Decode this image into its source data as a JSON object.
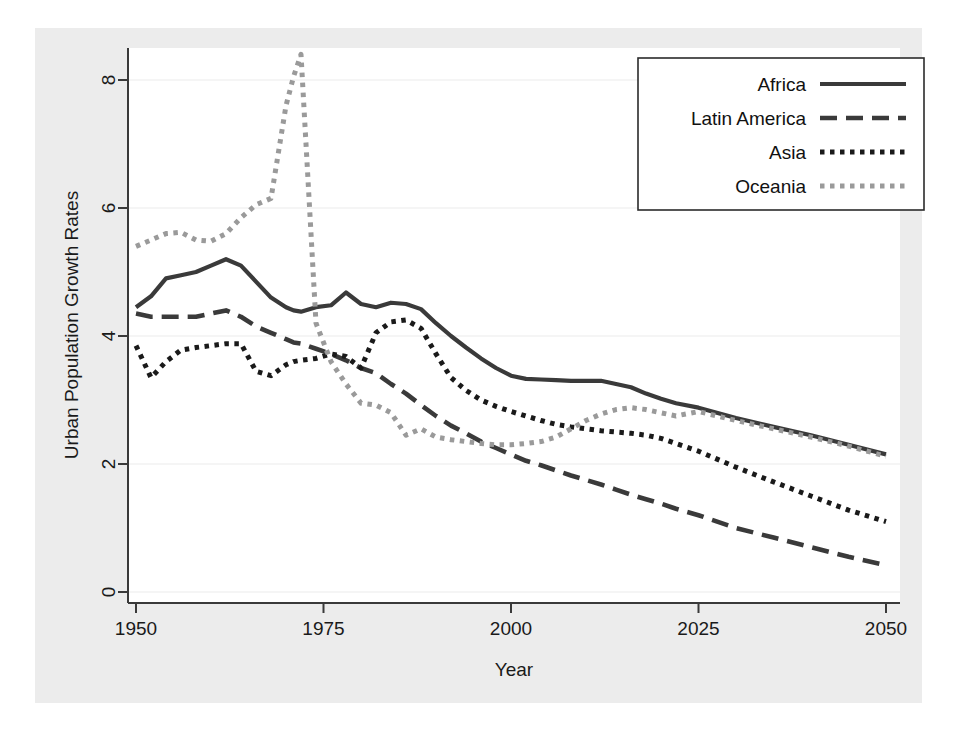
{
  "chart_data": {
    "type": "line",
    "title": "",
    "xlabel": "Year",
    "ylabel": "Urban Population Growth Rates",
    "xlim": [
      1950,
      2050
    ],
    "ylim": [
      0,
      8.6
    ],
    "xticks": [
      1950,
      1975,
      2000,
      2025,
      2050
    ],
    "yticks": [
      0,
      2,
      4,
      6,
      8
    ],
    "grid": "horizontal",
    "legend_position": "top-right",
    "legend_entries": [
      "Africa",
      "Latin America",
      "Asia",
      "Oceania"
    ],
    "x": [
      1950,
      1952,
      1954,
      1956,
      1958,
      1960,
      1962,
      1964,
      1966,
      1968,
      1970,
      1971,
      1972,
      1974,
      1976,
      1978,
      1980,
      1982,
      1984,
      1986,
      1988,
      1990,
      1992,
      1994,
      1996,
      1998,
      2000,
      2002,
      2004,
      2006,
      2008,
      2010,
      2012,
      2014,
      2016,
      2018,
      2020,
      2022,
      2025,
      2030,
      2035,
      2040,
      2045,
      2050
    ],
    "series": [
      {
        "name": "Africa",
        "style": "solid",
        "color": "#3a3a3a",
        "values": [
          4.45,
          4.62,
          4.9,
          4.95,
          5.0,
          5.1,
          5.2,
          5.1,
          4.85,
          4.6,
          4.45,
          4.4,
          4.38,
          4.45,
          4.48,
          4.68,
          4.5,
          4.45,
          4.52,
          4.5,
          4.42,
          4.2,
          4.0,
          3.82,
          3.65,
          3.5,
          3.38,
          3.33,
          3.32,
          3.31,
          3.3,
          3.3,
          3.3,
          3.25,
          3.2,
          3.1,
          3.02,
          2.95,
          2.88,
          2.72,
          2.58,
          2.45,
          2.3,
          2.15
        ]
      },
      {
        "name": "Latin America",
        "style": "dashed",
        "color": "#3a3a3a",
        "values": [
          4.35,
          4.3,
          4.3,
          4.3,
          4.3,
          4.35,
          4.4,
          4.3,
          4.15,
          4.05,
          3.95,
          3.9,
          3.88,
          3.8,
          3.72,
          3.62,
          3.5,
          3.42,
          3.25,
          3.1,
          2.92,
          2.75,
          2.6,
          2.48,
          2.35,
          2.25,
          2.15,
          2.05,
          1.98,
          1.9,
          1.82,
          1.75,
          1.68,
          1.6,
          1.52,
          1.45,
          1.38,
          1.3,
          1.2,
          1.0,
          0.85,
          0.7,
          0.55,
          0.42
        ]
      },
      {
        "name": "Asia",
        "style": "dotted",
        "color": "#1a1a1a",
        "values": [
          3.85,
          3.35,
          3.6,
          3.78,
          3.82,
          3.85,
          3.88,
          3.88,
          3.45,
          3.38,
          3.55,
          3.6,
          3.62,
          3.65,
          3.72,
          3.68,
          3.5,
          4.05,
          4.22,
          4.25,
          4.12,
          3.72,
          3.35,
          3.15,
          3.0,
          2.9,
          2.82,
          2.75,
          2.68,
          2.62,
          2.58,
          2.55,
          2.52,
          2.5,
          2.48,
          2.45,
          2.4,
          2.32,
          2.2,
          1.95,
          1.72,
          1.5,
          1.28,
          1.1
        ]
      },
      {
        "name": "Oceania",
        "style": "dotted-gray",
        "color": "#9a9a9a",
        "values": [
          5.4,
          5.5,
          5.6,
          5.62,
          5.5,
          5.48,
          5.6,
          5.85,
          6.05,
          6.15,
          7.6,
          8.05,
          8.4,
          4.2,
          3.6,
          3.25,
          2.95,
          2.92,
          2.8,
          2.45,
          2.55,
          2.42,
          2.38,
          2.35,
          2.32,
          2.3,
          2.3,
          2.32,
          2.35,
          2.42,
          2.55,
          2.68,
          2.78,
          2.85,
          2.88,
          2.85,
          2.8,
          2.75,
          2.82,
          2.68,
          2.55,
          2.42,
          2.28,
          2.12
        ]
      }
    ]
  },
  "axes": {
    "x_title": "Year",
    "y_title": "Urban Population Growth Rates",
    "x_tick_labels": [
      "1950",
      "1975",
      "2000",
      "2025",
      "2050"
    ],
    "y_tick_labels": [
      "0",
      "2",
      "4",
      "6",
      "8"
    ]
  },
  "legend": {
    "items": [
      {
        "label": "Africa",
        "swatch": "solid-line-swatch"
      },
      {
        "label": "Latin America",
        "swatch": "dashed-line-swatch"
      },
      {
        "label": "Asia",
        "swatch": "dotted-line-swatch"
      },
      {
        "label": "Oceania",
        "swatch": "dotted-gray-line-swatch"
      }
    ]
  },
  "colors": {
    "figure_background": "#ececec",
    "plot_background": "#ffffff",
    "gridline": "#ebebeb",
    "axis": "#3a3a3a",
    "dark_series": "#3a3a3a",
    "asia_series": "#1a1a1a",
    "oceania_series": "#9a9a9a"
  }
}
